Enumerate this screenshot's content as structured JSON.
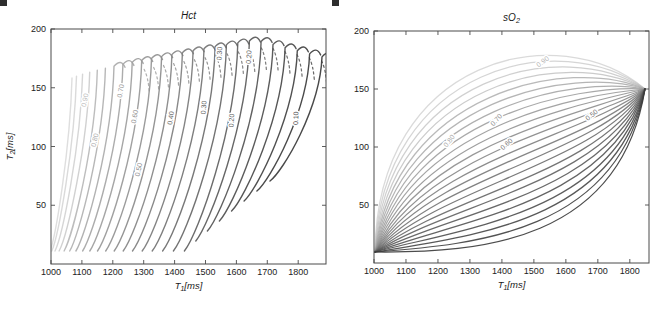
{
  "figure": {
    "width": 664,
    "height": 310,
    "background": "#ffffff",
    "spine_color": "#4a4a4a",
    "tick_label_color": "#222222",
    "title_color": "#1a1a1a"
  },
  "chart_data": [
    {
      "id": "hct",
      "type": "contour",
      "title": {
        "text": "Hct",
        "sub": "",
        "rest": ""
      },
      "xlabel": {
        "text": "T",
        "sub": "1",
        "rest": "[ms]"
      },
      "ylabel": {
        "text": "T",
        "sub": "2",
        "rest": "[ms]"
      },
      "xlim": [
        1000,
        1890
      ],
      "ylim": [
        0,
        200
      ],
      "xticks": [
        1000,
        1100,
        1200,
        1300,
        1400,
        1500,
        1600,
        1700,
        1800
      ],
      "yticks": [
        50,
        100,
        150,
        200
      ],
      "grid": false,
      "legend": null,
      "n_contour_lines": 26,
      "level_range": [
        0.05,
        0.95
      ],
      "levels_labeled": [
        0.9,
        0.8,
        0.7,
        0.6,
        0.5,
        0.4,
        0.3,
        0.2,
        0.1
      ],
      "contour_labels": [
        {
          "level": "0.90",
          "T1": 1117,
          "T2": 139,
          "rot": -78,
          "color": "#bdbdbd"
        },
        {
          "level": "0.80",
          "T1": 1149,
          "T2": 105,
          "rot": -77,
          "color": "#b3b3b3"
        },
        {
          "level": "0.70",
          "T1": 1233,
          "T2": 147,
          "rot": -80,
          "color": "#9e9e9e"
        },
        {
          "level": "0.60",
          "T1": 1278,
          "T2": 125,
          "rot": -80,
          "color": "#949494"
        },
        {
          "level": "0.50",
          "T1": 1291,
          "T2": 80,
          "rot": -79,
          "color": "#8a8a8a"
        },
        {
          "level": "0.40",
          "T1": 1395,
          "T2": 124,
          "rot": -82,
          "color": "#757575"
        },
        {
          "level": "0.30",
          "T1": 1502,
          "T2": 133,
          "rot": -85,
          "color": "#616161"
        },
        {
          "level": "0.30",
          "T1": 1553,
          "T2": 179,
          "rot": -87,
          "color": "#616161"
        },
        {
          "level": "0.20",
          "T1": 1592,
          "T2": 122,
          "rot": -86,
          "color": "#575757"
        },
        {
          "level": "0.20",
          "T1": 1648,
          "T2": 176,
          "rot": -87,
          "color": "#575757"
        },
        {
          "level": "0.10",
          "T1": 1800,
          "T2": 124,
          "rot": -88,
          "color": "#4f4f4f"
        }
      ],
      "px": {
        "x0": 51,
        "x1": 326,
        "y0": 29,
        "y1": 264
      }
    },
    {
      "id": "so2",
      "type": "contour",
      "title": {
        "text": "sO",
        "sub": "2",
        "rest": ""
      },
      "xlabel": {
        "text": "T",
        "sub": "1",
        "rest": "[ms]"
      },
      "ylabel": null,
      "xlim": [
        1000,
        1860
      ],
      "ylim": [
        0,
        200
      ],
      "xticks": [
        1000,
        1100,
        1200,
        1300,
        1400,
        1500,
        1600,
        1700,
        1800
      ],
      "yticks": [
        50,
        100,
        150,
        200
      ],
      "grid": false,
      "legend": null,
      "n_contour_lines": 24,
      "level_range": [
        0.05,
        0.98
      ],
      "levels_labeled": [
        0.9,
        0.8,
        0.7,
        0.6,
        0.5
      ],
      "contour_labels": [
        {
          "level": "0.90",
          "T1": 1532,
          "T2": 172,
          "rot": -36,
          "color": "#b6b6b6"
        },
        {
          "level": "0.80",
          "T1": 1241,
          "T2": 104,
          "rot": -52,
          "color": "#ababab"
        },
        {
          "level": "0.70",
          "T1": 1388,
          "T2": 122,
          "rot": -48,
          "color": "#919191"
        },
        {
          "level": "0.60",
          "T1": 1419,
          "T2": 101,
          "rot": -42,
          "color": "#838383"
        },
        {
          "level": "0.50",
          "T1": 1685,
          "T2": 126,
          "rot": -38,
          "color": "#6f6f6f"
        }
      ],
      "px": {
        "x0": 374,
        "x1": 649,
        "y0": 31,
        "y1": 263
      }
    }
  ]
}
